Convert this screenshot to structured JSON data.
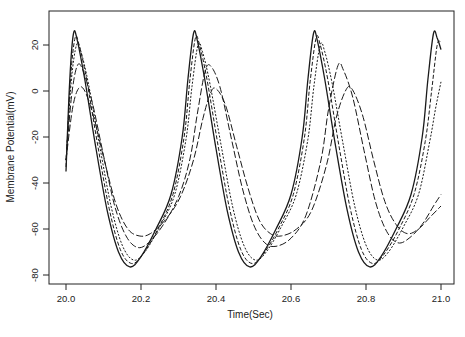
{
  "chart_data": {
    "type": "line",
    "title": "",
    "xlabel": "Time(Sec)",
    "ylabel": "Membrane Potential(mV)",
    "xlim": [
      19.96,
      21.04
    ],
    "ylim": [
      -84,
      35
    ],
    "x_ticks": [
      20.0,
      20.2,
      20.4,
      20.6,
      20.8,
      21.0
    ],
    "x_tick_labels": [
      "20.0",
      "20.2",
      "20.4",
      "20.6",
      "20.8",
      "21.0"
    ],
    "y_ticks": [
      20,
      0,
      -20,
      -40,
      -60,
      -80
    ],
    "y_tick_labels": [
      "20",
      "0",
      "-20",
      "-40",
      "-60",
      "-80"
    ],
    "grid": false,
    "legend": null,
    "series": [
      {
        "name": "trace-1",
        "style": "solid",
        "color": "#1a1a1a",
        "t": [
          20.0,
          20.01,
          20.02,
          20.03,
          20.05,
          20.08,
          20.11,
          20.14,
          20.17,
          20.2,
          20.24,
          20.28,
          20.31,
          20.325,
          20.34,
          20.35,
          20.37,
          20.4,
          20.43,
          20.46,
          20.49,
          20.52,
          20.56,
          20.6,
          20.63,
          20.645,
          20.66,
          20.67,
          20.69,
          20.72,
          20.75,
          20.78,
          20.81,
          20.84,
          20.88,
          20.92,
          20.95,
          20.965,
          20.98,
          20.99,
          21.0
        ],
        "v": [
          -35,
          5,
          25,
          22,
          5,
          -25,
          -52,
          -70,
          -76.5,
          -72,
          -60,
          -45,
          -20,
          5,
          25,
          22,
          5,
          -25,
          -52,
          -70,
          -76.5,
          -72,
          -60,
          -45,
          -20,
          5,
          25,
          22,
          5,
          -25,
          -52,
          -70,
          -76.5,
          -72,
          -60,
          -45,
          -20,
          5,
          25,
          23,
          18
        ]
      },
      {
        "name": "trace-2",
        "style": "dashed",
        "color": "#1a1a1a",
        "t": [
          20.0,
          20.012,
          20.024,
          20.035,
          20.055,
          20.085,
          20.115,
          20.145,
          20.175,
          20.205,
          20.245,
          20.285,
          20.315,
          20.33,
          20.345,
          20.356,
          20.376,
          20.406,
          20.436,
          20.466,
          20.496,
          20.526,
          20.566,
          20.606,
          20.636,
          20.651,
          20.667,
          20.678,
          20.698,
          20.728,
          20.758,
          20.788,
          20.818,
          20.848,
          20.888,
          20.928,
          20.958,
          20.975,
          20.99,
          21.0
        ],
        "v": [
          -33,
          5,
          23,
          20,
          5,
          -24,
          -51,
          -69,
          -75,
          -71,
          -60,
          -45,
          -20,
          4,
          23,
          20,
          5,
          -24,
          -51,
          -69,
          -75,
          -71,
          -60,
          -45,
          -20,
          4,
          23,
          20,
          5,
          -24,
          -51,
          -69,
          -75,
          -71,
          -60,
          -45,
          -22,
          0,
          20,
          21
        ]
      },
      {
        "name": "trace-3",
        "style": "dotted",
        "color": "#1a1a1a",
        "t": [
          20.0,
          20.014,
          20.028,
          20.04,
          20.06,
          20.09,
          20.12,
          20.15,
          20.18,
          20.21,
          20.25,
          20.29,
          20.32,
          20.336,
          20.352,
          20.364,
          20.384,
          20.414,
          20.444,
          20.474,
          20.504,
          20.534,
          20.574,
          20.614,
          20.645,
          20.661,
          20.678,
          20.69,
          20.71,
          20.74,
          20.77,
          20.8,
          20.83,
          20.86,
          20.9,
          20.94,
          20.97,
          20.985,
          21.0
        ],
        "v": [
          -30,
          4,
          20,
          17,
          3,
          -24,
          -50,
          -67,
          -73.5,
          -70,
          -59,
          -45,
          -21,
          2,
          20,
          17,
          3,
          -24,
          -50,
          -67,
          -73.5,
          -70,
          -59,
          -45,
          -21,
          2,
          20,
          17,
          3,
          -24,
          -50,
          -67,
          -73.5,
          -70,
          -59,
          -45,
          -22,
          -8,
          4
        ]
      },
      {
        "name": "trace-4",
        "style": "longdash",
        "color": "#1a1a1a",
        "t": [
          20.0,
          20.015,
          20.03,
          20.045,
          20.07,
          20.1,
          20.13,
          20.16,
          20.19,
          20.22,
          20.26,
          20.3,
          20.33,
          20.35,
          20.37,
          20.385,
          20.41,
          20.44,
          20.47,
          20.5,
          20.53,
          20.56,
          20.6,
          20.64,
          20.68,
          20.7,
          20.725,
          20.74,
          20.765,
          20.795,
          20.825,
          20.855,
          20.885,
          20.915,
          20.95,
          20.98,
          21.0
        ],
        "v": [
          -30,
          -2,
          11,
          9,
          -5,
          -28,
          -50,
          -63,
          -68,
          -66,
          -58,
          -46,
          -30,
          -10,
          8,
          11,
          2,
          -20,
          -42,
          -58,
          -66,
          -67.5,
          -64,
          -54,
          -30,
          -8,
          11,
          9,
          -3,
          -26,
          -48,
          -61,
          -66,
          -64,
          -58,
          -50,
          -45
        ]
      },
      {
        "name": "trace-5",
        "style": "longdash",
        "color": "#1a1a1a",
        "t": [
          20.0,
          20.017,
          20.033,
          20.05,
          20.075,
          20.105,
          20.135,
          20.165,
          20.195,
          20.225,
          20.265,
          20.305,
          20.34,
          20.365,
          20.385,
          20.4,
          20.425,
          20.455,
          20.485,
          20.515,
          20.545,
          20.575,
          20.615,
          20.655,
          20.695,
          20.72,
          20.745,
          20.762,
          20.79,
          20.82,
          20.85,
          20.88,
          20.91,
          20.94,
          20.97,
          21.0
        ],
        "v": [
          -30,
          -8,
          1,
          0,
          -12,
          -32,
          -50,
          -60,
          -63,
          -62,
          -56,
          -46,
          -30,
          -12,
          -1,
          1,
          -6,
          -24,
          -42,
          -56,
          -62,
          -63,
          -60,
          -52,
          -32,
          -12,
          0,
          1,
          -10,
          -30,
          -48,
          -58,
          -62,
          -60,
          -55,
          -50
        ]
      }
    ]
  }
}
